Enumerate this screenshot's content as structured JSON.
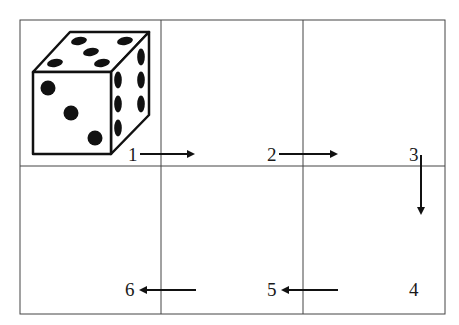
{
  "diagram": {
    "grid": {
      "rows": 2,
      "cols": 3
    },
    "die": {
      "front_face_pips": 3,
      "top_face_pips": 5,
      "right_face_pips": 6
    },
    "steps": [
      {
        "label": "1",
        "direction": "right"
      },
      {
        "label": "2",
        "direction": "right"
      },
      {
        "label": "3",
        "direction": "down"
      },
      {
        "label": "4",
        "direction": "none"
      },
      {
        "label": "5",
        "direction": "left"
      },
      {
        "label": "6",
        "direction": "left"
      }
    ],
    "colors": {
      "line": "#333333",
      "ink": "#111111",
      "background": "#ffffff"
    }
  }
}
